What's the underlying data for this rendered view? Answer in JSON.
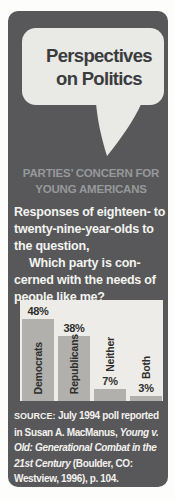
{
  "header": {
    "title_line1": "Perspectives",
    "title_line2": "on Politics"
  },
  "section": {
    "heading_line1": "PARTIES’ CONCERN FOR",
    "heading_line2": "YOUNG AMERICANS",
    "intro_lines": [
      {
        "text": "Responses of eighteen- to",
        "indent": false
      },
      {
        "text": "twenty-nine-year-olds to",
        "indent": false
      },
      {
        "text": "the question,",
        "indent": false
      },
      {
        "text": "Which party is con-",
        "indent": true
      },
      {
        "text": "cerned with the needs of",
        "indent": false
      },
      {
        "text": "people like me?",
        "indent": false
      }
    ]
  },
  "chart_data": {
    "type": "bar",
    "categories": [
      "Democrats",
      "Republicans",
      "Neither",
      "Both"
    ],
    "values": [
      48,
      38,
      7,
      3
    ],
    "value_labels": [
      "48%",
      "38%",
      "7%",
      "3%"
    ],
    "xlabel": "",
    "ylabel": "",
    "ylim": [
      0,
      55
    ],
    "grid": false,
    "legend": false,
    "panel_color": "#edece8",
    "bar_color": "#b1b0ac",
    "label_color": "#2e2e2d"
  },
  "source": {
    "lines": [
      [
        {
          "text": "SOURCE:",
          "style": "caps"
        },
        {
          "text": " July 1994 poll reported",
          "style": "normal"
        }
      ],
      [
        {
          "text": "in Susan A. MacManus, ",
          "style": "normal"
        },
        {
          "text": "Young v.",
          "style": "italic"
        }
      ],
      [
        {
          "text": "Old: Generational Combat in the",
          "style": "italic"
        }
      ],
      [
        {
          "text": "21st Century",
          "style": "italic"
        },
        {
          "text": " (Boulder, CO:",
          "style": "normal"
        }
      ],
      [
        {
          "text": "Westview, 1996), p. 104.",
          "style": "normal"
        }
      ]
    ]
  },
  "colors": {
    "card_background": "#58585a",
    "bubble_background": "#e9e9e5",
    "title_text": "#3b3c3e",
    "heading_text": "#96999a",
    "body_text": "#f3f3f0"
  }
}
